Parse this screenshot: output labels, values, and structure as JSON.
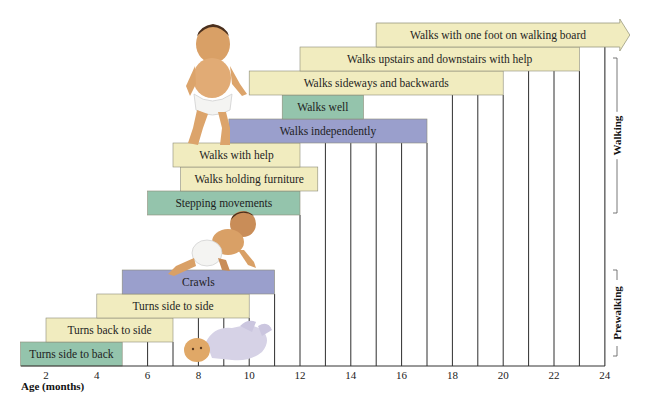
{
  "chart_data": {
    "type": "bar",
    "subtype": "horizontal-range (gantt)",
    "title": "",
    "xlabel": "Age (months)",
    "ylabel": "",
    "xlim": [
      1,
      24
    ],
    "x_ticks": [
      2,
      4,
      6,
      8,
      10,
      12,
      14,
      16,
      18,
      20,
      22,
      24
    ],
    "grid": "vertical lines at every month",
    "legend": "none",
    "colors": {
      "yellow": "#f1ecbf",
      "green": "#94c4ac",
      "blue": "#9a9fcc",
      "grid": "#333333"
    },
    "milestones": [
      {
        "label": "Turns side to back",
        "start": 1,
        "end": 5,
        "color": "green",
        "phase": "Prewalking"
      },
      {
        "label": "Turns back to side",
        "start": 2,
        "end": 7,
        "color": "yellow",
        "phase": "Prewalking"
      },
      {
        "label": "Turns side to side",
        "start": 4,
        "end": 10,
        "color": "yellow",
        "phase": "Prewalking"
      },
      {
        "label": "Crawls",
        "start": 5,
        "end": 11,
        "color": "blue",
        "phase": "Prewalking"
      },
      {
        "label": "Stepping movements",
        "start": 6,
        "end": 12,
        "color": "green",
        "phase": "Walking"
      },
      {
        "label": "Walks holding furniture",
        "start": 7.3,
        "end": 12.7,
        "color": "yellow",
        "phase": "Walking"
      },
      {
        "label": "Walks with help",
        "start": 7,
        "end": 12,
        "color": "yellow",
        "phase": "Walking"
      },
      {
        "label": "Walks independently",
        "start": 9.2,
        "end": 17,
        "color": "blue",
        "phase": "Walking"
      },
      {
        "label": "Walks well",
        "start": 11.3,
        "end": 14.5,
        "color": "green",
        "phase": "Walking"
      },
      {
        "label": "Walks sideways and backwards",
        "start": 10,
        "end": 20,
        "color": "yellow",
        "phase": "Walking"
      },
      {
        "label": "Walks upstairs and downstairs with help",
        "start": 12,
        "end": 23,
        "color": "yellow",
        "phase": "Walking"
      },
      {
        "label": "Walks with one foot on walking board",
        "start": 15,
        "end": 24,
        "color": "yellow",
        "phase": "Walking",
        "open_ended": true
      }
    ],
    "phases": [
      {
        "label": "Walking",
        "y_top": 58,
        "y_bottom": 213
      },
      {
        "label": "Prewalking",
        "y_top": 270,
        "y_bottom": 356
      }
    ],
    "illustrations": [
      "standing-baby",
      "crawling-baby",
      "lying-baby"
    ]
  }
}
